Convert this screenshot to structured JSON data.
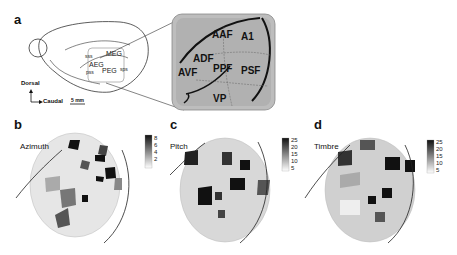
{
  "panels": {
    "a": {
      "letter": "a",
      "brain_labels": {
        "sss": "sss",
        "meg": "MEG",
        "aeg": "AEG",
        "peg": "PEG",
        "pss": "pss",
        "sps": "sps"
      },
      "axes": {
        "dorsal": "Dorsal",
        "caudal": "Caudal",
        "scale": "5 mm"
      },
      "fields": [
        "AAF",
        "A1",
        "ADF",
        "AVF",
        "PPF",
        "PSF",
        "VP"
      ]
    },
    "b": {
      "letter": "b",
      "title": "Azimuth",
      "colorbar_ticks": [
        "8",
        "6",
        "4",
        "2"
      ]
    },
    "c": {
      "letter": "c",
      "title": "Pitch",
      "colorbar_ticks": [
        "25",
        "20",
        "15",
        "10",
        "5"
      ]
    },
    "d": {
      "letter": "d",
      "title": "Timbre",
      "colorbar_ticks": [
        "25",
        "20",
        "15",
        "10",
        "5"
      ]
    }
  }
}
